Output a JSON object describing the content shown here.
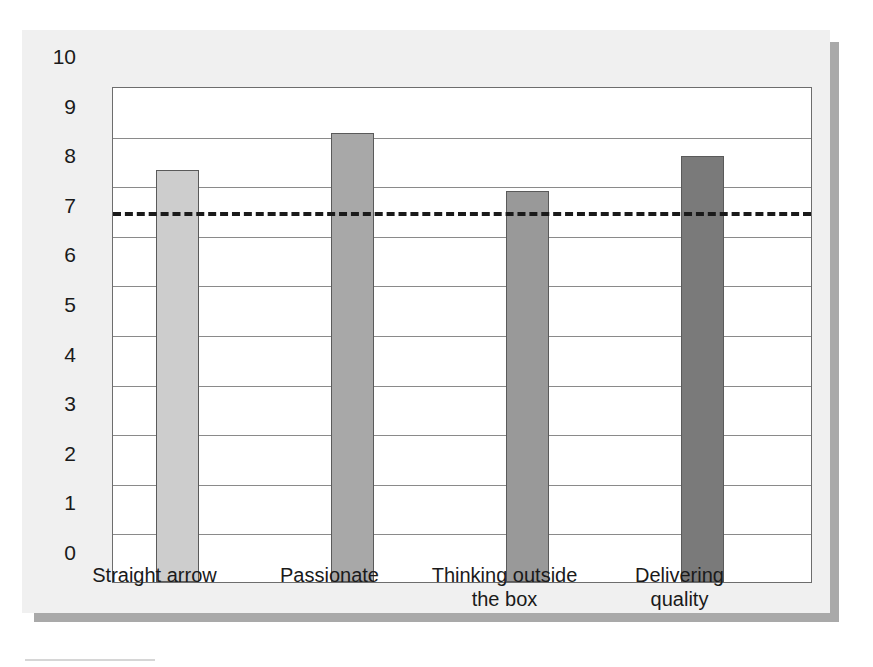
{
  "chart_data": {
    "type": "bar",
    "title": "",
    "subtitle": "",
    "xlabel": "",
    "ylabel": "",
    "ylim": [
      0,
      10
    ],
    "ytick_step": 1,
    "yticks": [
      "10",
      "9",
      "8",
      "7",
      "6",
      "5",
      "4",
      "3",
      "2",
      "1",
      "0"
    ],
    "grid": true,
    "legend": "none",
    "categories": [
      "Straight arrow",
      "Passionate",
      "Thinking outside\nthe box",
      "Delivering\nquality"
    ],
    "values": [
      8.3,
      9.05,
      7.88,
      8.58
    ],
    "bar_colors": [
      "#cdcdcd",
      "#a8a8a8",
      "#999999",
      "#7a7a7a"
    ],
    "annotations": [
      {
        "name": "reference-line",
        "kind": "horizontal-dashed-line",
        "value": 7.5,
        "color": "#1a1a1a"
      }
    ]
  },
  "colors": {
    "card_background": "#f0f0f0",
    "plot_background": "#ffffff",
    "axis": "#6d6d6d",
    "gridline": "#8a8a8a",
    "shadow": "#a9a9a9",
    "text": "#1a1a1a"
  }
}
